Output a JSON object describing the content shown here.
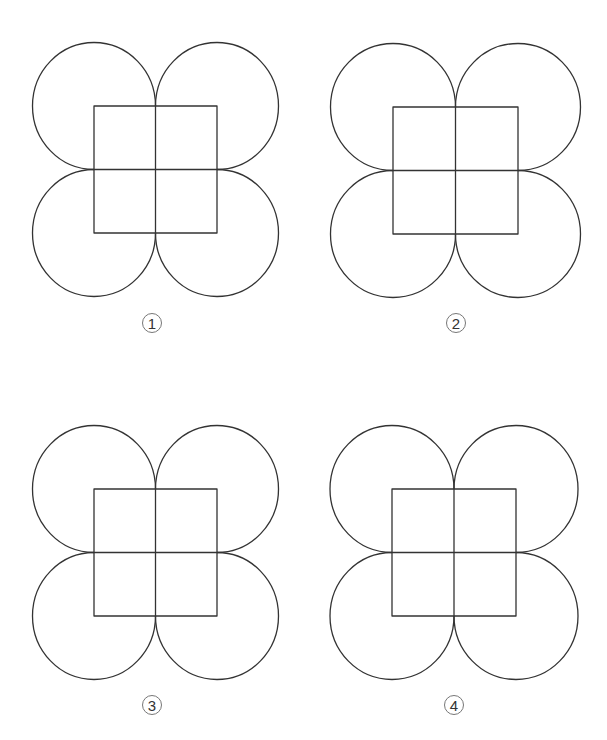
{
  "page": {
    "background": "#ffffff",
    "line_color": "#333333",
    "line_width": 1.3
  },
  "figures": [
    {
      "id": "figure-1",
      "label": "1",
      "square": {
        "x": 94,
        "y": 106,
        "w": 123,
        "h": 127
      },
      "label_pos": {
        "x": 152,
        "y": 323
      }
    },
    {
      "id": "figure-2",
      "label": "2",
      "square": {
        "x": 393,
        "y": 107,
        "w": 125,
        "h": 127
      },
      "label_pos": {
        "x": 456,
        "y": 323
      }
    },
    {
      "id": "figure-3",
      "label": "3",
      "square": {
        "x": 94,
        "y": 489,
        "w": 123,
        "h": 127
      },
      "label_pos": {
        "x": 152,
        "y": 705
      }
    },
    {
      "id": "figure-4",
      "label": "4",
      "square": {
        "x": 392,
        "y": 489,
        "w": 124,
        "h": 127
      },
      "label_pos": {
        "x": 454,
        "y": 705
      }
    }
  ]
}
